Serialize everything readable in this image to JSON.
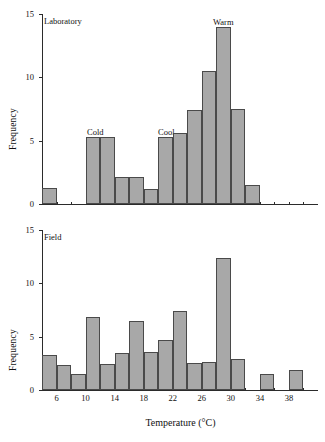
{
  "figure": {
    "background": "#ffffff",
    "bar_fill": "#a8a8a8",
    "bar_stroke": "#4a4a4a",
    "axis_color": "#2b2b2b"
  },
  "chart_data": [
    {
      "type": "bar",
      "title": "Laboratory",
      "panel_tag": "Laboratory",
      "xlabel": "",
      "ylabel": "Frequency",
      "ylim": [
        0,
        15
      ],
      "yticks": [
        0,
        5,
        10,
        15
      ],
      "ytick_labels": [
        "0",
        "5",
        "10",
        "15"
      ],
      "xlim": [
        4,
        42
      ],
      "xticks": [
        6,
        8,
        10,
        12,
        14,
        16,
        18,
        20,
        22,
        24,
        26,
        28,
        30,
        32,
        34,
        36,
        38,
        40
      ],
      "xtick_labels": [
        "",
        "",
        "",
        "",
        "",
        "",
        "",
        "",
        "",
        "",
        "",
        "",
        "",
        "",
        "",
        "",
        "",
        ""
      ],
      "grid": false,
      "legend": "none",
      "bin_width": 2,
      "bin_starts": [
        4,
        10,
        12,
        14,
        16,
        18,
        20,
        22,
        24,
        26,
        28,
        30,
        32
      ],
      "categories": [
        "4-6",
        "10-12",
        "12-14",
        "14-16",
        "16-18",
        "18-20",
        "20-22",
        "22-24",
        "24-26",
        "26-28",
        "28-30",
        "30-32",
        "32-34"
      ],
      "values": [
        1.3,
        5.3,
        5.3,
        2.1,
        2.1,
        1.2,
        5.3,
        5.6,
        7.4,
        10.5,
        14.0,
        7.5,
        1.5
      ],
      "annotations": [
        {
          "text": "Cold",
          "x_bin": "10-12"
        },
        {
          "text": "Cool",
          "x_bin": "20-22"
        },
        {
          "text": "Warm",
          "x_bin": "28-30"
        }
      ]
    },
    {
      "type": "bar",
      "title": "Field",
      "panel_tag": "Field",
      "xlabel": "Temperature (°C)",
      "ylabel": "Frequency",
      "ylim": [
        0,
        15
      ],
      "yticks": [
        0,
        5,
        10,
        15
      ],
      "ytick_labels": [
        "0",
        "5",
        "10",
        "15"
      ],
      "xlim": [
        4,
        42
      ],
      "xticks": [
        6,
        8,
        10,
        12,
        14,
        16,
        18,
        20,
        22,
        24,
        26,
        28,
        30,
        32,
        34,
        36,
        38,
        40
      ],
      "xtick_labels": [
        "6",
        "",
        "10",
        "",
        "14",
        "",
        "18",
        "",
        "22",
        "",
        "26",
        "",
        "30",
        "",
        "34",
        "",
        "38",
        ""
      ],
      "grid": false,
      "legend": "none",
      "bin_width": 2,
      "bin_starts": [
        4,
        6,
        8,
        10,
        12,
        14,
        16,
        18,
        20,
        22,
        24,
        26,
        28,
        30,
        32,
        34,
        36,
        38,
        40
      ],
      "categories": [
        "4-6",
        "6-8",
        "8-10",
        "10-12",
        "12-14",
        "14-16",
        "16-18",
        "18-20",
        "20-22",
        "22-24",
        "24-26",
        "26-28",
        "28-30",
        "30-32",
        "32-34",
        "34-36",
        "36-38",
        "38-40",
        "40-42"
      ],
      "values": [
        3.3,
        2.3,
        1.5,
        6.8,
        2.4,
        3.5,
        6.5,
        3.6,
        4.7,
        7.4,
        2.5,
        2.6,
        12.4,
        2.9,
        0,
        1.5,
        0,
        1.9,
        0
      ],
      "annotations": []
    }
  ],
  "labels": {
    "y_axis_title": "Frequency",
    "x_axis_title": "Temperature (°C)",
    "lab_tag": "Laboratory",
    "field_tag": "Field",
    "anno_cold": "Cold",
    "anno_cool": "Cool",
    "anno_warm": "Warm"
  }
}
